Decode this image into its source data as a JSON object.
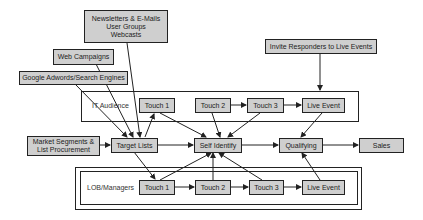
{
  "diagram": {
    "sources": {
      "newsletters": "Newsletters & E-Mails\nUser Groups\nWebcasts",
      "web_campaigns": "Web Campaigns",
      "google": "Google Adwords/Search Engines",
      "invite": "Invite Responders to Live Events",
      "market_segments": "Market Segments &\nList Procurement"
    },
    "groups": {
      "it_audience": {
        "label": "IT Audience",
        "touches": [
          "Touch 1",
          "Touch 2",
          "Touch 3"
        ],
        "live_event": "Live Event"
      },
      "lob_managers": {
        "label": "LOB/Managers",
        "touches": [
          "Touch 1",
          "Touch 2",
          "Touch 3"
        ],
        "live_event": "Live Event"
      }
    },
    "pipeline": {
      "target_lists": "Target Lists",
      "self_identify": "Self Identify",
      "qualifying": "Qualifying",
      "sales": "Sales"
    },
    "colors": {
      "node_fill": "#cfcfcf",
      "stroke": "#222222",
      "background": "#ffffff"
    }
  }
}
